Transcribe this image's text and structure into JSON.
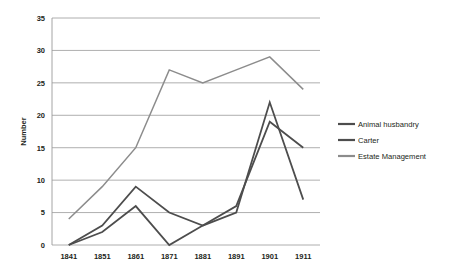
{
  "chart_data": {
    "type": "line",
    "title": "",
    "xlabel": "",
    "ylabel": "Number",
    "categories": [
      "1841",
      "1851",
      "1861",
      "1871",
      "1881",
      "1891",
      "1901",
      "1911"
    ],
    "x_tick_labels": [
      "1841",
      "1851",
      "1861",
      "1871",
      "1881",
      "1891",
      "1901",
      "1911"
    ],
    "y_tick_labels": [
      "0",
      "5",
      "10",
      "15",
      "20",
      "25",
      "30",
      "35"
    ],
    "y_ticks": [
      0,
      5,
      10,
      15,
      20,
      25,
      30,
      35
    ],
    "ylim": [
      0,
      35
    ],
    "grid": "horizontal",
    "legend_position": "right",
    "series": [
      {
        "name": "Animal husbandry",
        "color": "#4d4d4d",
        "values": [
          0,
          2,
          6,
          0,
          3,
          5,
          22,
          7
        ]
      },
      {
        "name": "Carter",
        "color": "#4d4d4d",
        "values": [
          0,
          3,
          9,
          5,
          3,
          6,
          19,
          15
        ]
      },
      {
        "name": "Estate Management",
        "color": "#8c8c8c",
        "values": [
          4,
          9,
          15,
          27,
          25,
          27,
          29,
          24
        ]
      }
    ]
  },
  "axis": {
    "y_title": "Number"
  },
  "legend": {
    "entries": [
      {
        "label": "Animal husbandry"
      },
      {
        "label": "Carter"
      },
      {
        "label": "Estate Management"
      }
    ]
  },
  "colors": {
    "series_dark": "#4d4d4d",
    "series_light": "#8c8c8c",
    "gridline": "#9a9a9a",
    "frame": "#9a9a9a",
    "text": "#231f20",
    "background": "#ffffff"
  }
}
